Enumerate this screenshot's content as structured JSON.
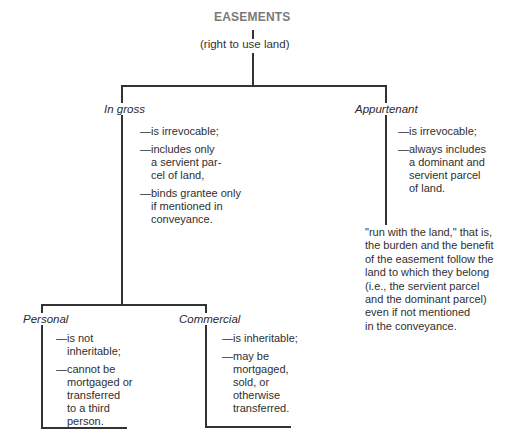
{
  "root": {
    "title": "EASEMENTS",
    "subtitle": "(right to use land)"
  },
  "branches": {
    "in_gross": {
      "label": "In gross",
      "items": [
        "—is irrevocable;",
        "—includes only\na servient par-\ncel of land,",
        "—binds grantee only\nif mentioned in\nconveyance."
      ],
      "children": {
        "personal": {
          "label": "Personal",
          "items": [
            "—is not\ninheritable;",
            "—cannot be\nmortgaged or\ntransferred\nto a third\nperson."
          ]
        },
        "commercial": {
          "label": "Commercial",
          "items": [
            "—is inheritable;",
            "—may be\nmortgaged,\nsold, or\notherwise\ntransferred."
          ]
        }
      }
    },
    "appurtenant": {
      "label": "Appurtenant",
      "items": [
        "—is irrevocable;",
        "—always includes\na dominant and\nservient parcel\nof land."
      ],
      "note": "\"run with the land,\" that is,\nthe burden and the benefit\nof the easement follow the\nland to which they belong\n(i.e., the servient parcel\nand the dominant parcel)\neven if not mentioned\nin the conveyance."
    }
  }
}
